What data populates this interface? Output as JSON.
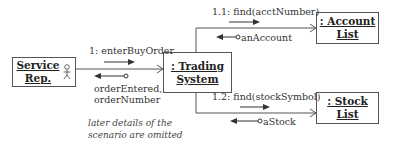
{
  "objects": {
    "service_rep": {
      "line1": "Service",
      "line2": "Rep.",
      "icon": "actor-icon"
    },
    "trading_system": {
      "line1": ": Trading",
      "line2": "System"
    },
    "account_list": {
      "line1": ": Account",
      "line2": "List"
    },
    "stock_list": {
      "line1": ": Stock",
      "line2": "List"
    }
  },
  "messages": {
    "m1": "1: enterBuyOrder",
    "m1_return_line1": "orderEntered,",
    "m1_return_line2": "orderNumber",
    "m11": "1.1: find(acctNumber)",
    "m11_return": "anAccount",
    "m12": "1.2: find(stockSymbol)",
    "m12_return": "aStock"
  },
  "note": {
    "line1": "later details of the",
    "line2": "scenario are omitted"
  }
}
